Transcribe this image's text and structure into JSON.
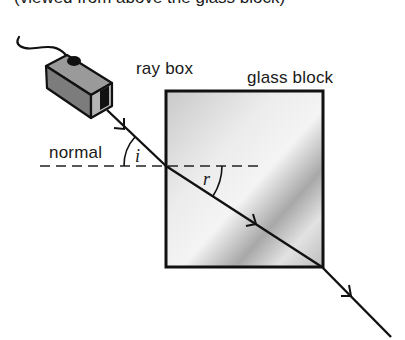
{
  "caption_partial": "(viewed from above the glass block)",
  "labels": {
    "ray_box": "ray box",
    "glass_block": "glass block",
    "normal": "normal",
    "angle_incidence": "i",
    "angle_refraction": "r"
  },
  "colors": {
    "line": "#111111",
    "glass_light": "#f2f2f2",
    "glass_mid": "#d4d4d4",
    "glass_dark": "#a9a9a9",
    "box_side": "#7a7a7a",
    "box_top": "#9a9a9a",
    "box_front": "#b5b5b5"
  },
  "geometry": {
    "glass_block": {
      "x": 166,
      "y": 91,
      "width": 157,
      "height": 176
    },
    "incident_ray": {
      "x1": 107,
      "y1": 110,
      "x2": 166,
      "y2": 166
    },
    "refracted_ray": {
      "x1": 166,
      "y1": 166,
      "x2": 322,
      "y2": 267
    },
    "emergent_ray": {
      "x1": 322,
      "y1": 267,
      "x2": 391,
      "y2": 337
    },
    "normal_line": {
      "x1": 40,
      "y1": 166,
      "x2": 264,
      "y2": 166
    }
  }
}
